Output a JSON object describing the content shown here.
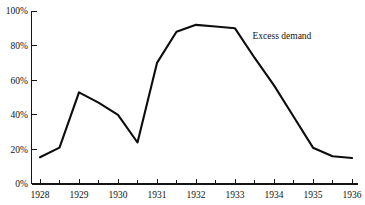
{
  "chart_data": {
    "type": "line",
    "title": "",
    "subtitle": "",
    "xlabel": "",
    "ylabel": "",
    "xlim": [
      1928,
      1936
    ],
    "ylim": [
      0,
      100
    ],
    "grid": false,
    "legend_position": "none",
    "x_tick_labels": [
      "1928",
      "1929",
      "1930",
      "1931",
      "1932",
      "1933",
      "1934",
      "1935",
      "1936"
    ],
    "x_ticks": [
      1928,
      1929,
      1930,
      1931,
      1932,
      1933,
      1934,
      1935,
      1936
    ],
    "x_minor_ticks": [
      1928.5,
      1929.5,
      1930.5,
      1931.5,
      1932.5,
      1933.5,
      1934.5,
      1935.5
    ],
    "y_tick_labels": [
      "0%",
      "20%",
      "40%",
      "60%",
      "80%",
      "100%"
    ],
    "y_ticks": [
      0,
      20,
      40,
      60,
      80,
      100
    ],
    "series": [
      {
        "name": "Excess demand",
        "annotation": "Excess demand",
        "annotation_x": 1933.45,
        "annotation_y": 84,
        "color": "#0d0d0d",
        "x": [
          1928,
          1928.5,
          1929,
          1929.5,
          1930,
          1930.5,
          1931,
          1931.5,
          1932,
          1932.5,
          1933,
          1933.5,
          1934,
          1934.5,
          1935,
          1935.5,
          1936
        ],
        "values": [
          15.5,
          21,
          53,
          47,
          40,
          24,
          70,
          88,
          92,
          91,
          90,
          73,
          57,
          39,
          21,
          16,
          15
        ]
      }
    ]
  },
  "annotations": {
    "excess_demand": "Excess demand"
  }
}
